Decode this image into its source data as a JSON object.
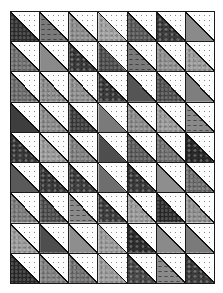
{
  "quilt": {
    "title": "Half-square triangle quilt",
    "columns": 7,
    "rows": 9,
    "light_triangle": {
      "position": "upper-right",
      "fill": "#fdfdfd",
      "pattern": "dots",
      "dot_color": "#8a8a8a"
    },
    "dark_triangle": {
      "position": "lower-left"
    },
    "seam_color": "#1a1a1a",
    "cells": [
      [
        {
          "c": "#2f2f2f",
          "p": "mottled"
        },
        {
          "c": "#7a7a7a",
          "p": "leaf"
        },
        {
          "c": "#8c8c8c",
          "p": "mottled"
        },
        {
          "c": "#a0a0a0",
          "p": "mottled"
        },
        {
          "c": "#555555",
          "p": "mottled"
        },
        {
          "c": "#3e3e3e",
          "p": "paisley"
        },
        {
          "c": "#8a8a8a",
          "p": "solid"
        }
      ],
      [
        {
          "c": "#6e6e6e",
          "p": "mottled"
        },
        {
          "c": "#8a8a8a",
          "p": "solid"
        },
        {
          "c": "#3a3a3a",
          "p": "paisley"
        },
        {
          "c": "#4a4a4a",
          "p": "mottled"
        },
        {
          "c": "#7a7a7a",
          "p": "leaf"
        },
        {
          "c": "#8e8e8e",
          "p": "mottled"
        },
        {
          "c": "#9a9a9a",
          "p": "mottled"
        }
      ],
      [
        {
          "c": "#6a6a6a",
          "p": "mottled"
        },
        {
          "c": "#8a8a8a",
          "p": "mottled"
        },
        {
          "c": "#8e8e8e",
          "p": "mottled"
        },
        {
          "c": "#3a3a3a",
          "p": "paisley"
        },
        {
          "c": "#555555",
          "p": "solid"
        },
        {
          "c": "#4e4e4e",
          "p": "mottled"
        },
        {
          "c": "#7e7e7e",
          "p": "solid"
        }
      ],
      [
        {
          "c": "#3e3e3e",
          "p": "solid"
        },
        {
          "c": "#8a8a8a",
          "p": "mottled"
        },
        {
          "c": "#3a3a3a",
          "p": "mottled"
        },
        {
          "c": "#7a7a7a",
          "p": "solid"
        },
        {
          "c": "#8a8a8a",
          "p": "mottled"
        },
        {
          "c": "#9a9a9a",
          "p": "mottled"
        },
        {
          "c": "#8a8a8a",
          "p": "leaf"
        }
      ],
      [
        {
          "c": "#3a3a3a",
          "p": "paisley"
        },
        {
          "c": "#9a9a9a",
          "p": "mottled"
        },
        {
          "c": "#7e7e7e",
          "p": "mottled"
        },
        {
          "c": "#4e4e4e",
          "p": "solid"
        },
        {
          "c": "#5a5a5a",
          "p": "mottled"
        },
        {
          "c": "#6e6e6e",
          "p": "mottled"
        },
        {
          "c": "#2a2a2a",
          "p": "paisley"
        }
      ],
      [
        {
          "c": "#5a5a5a",
          "p": "solid"
        },
        {
          "c": "#3a3a3a",
          "p": "paisley"
        },
        {
          "c": "#3e3e3e",
          "p": "paisley"
        },
        {
          "c": "#6e6e6e",
          "p": "solid"
        },
        {
          "c": "#3a3a3a",
          "p": "paisley"
        },
        {
          "c": "#8e8e8e",
          "p": "solid"
        },
        {
          "c": "#6a6a6a",
          "p": "mottled"
        }
      ],
      [
        {
          "c": "#7a7a7a",
          "p": "mottled"
        },
        {
          "c": "#4a4a4a",
          "p": "mottled"
        },
        {
          "c": "#8a8a8a",
          "p": "leaf"
        },
        {
          "c": "#3e3e3e",
          "p": "paisley"
        },
        {
          "c": "#9a9a9a",
          "p": "mottled"
        },
        {
          "c": "#2a2a2a",
          "p": "mottled"
        },
        {
          "c": "#8e8e8e",
          "p": "mottled"
        }
      ],
      [
        {
          "c": "#9a9a9a",
          "p": "mottled"
        },
        {
          "c": "#4e4e4e",
          "p": "solid"
        },
        {
          "c": "#8e8e8e",
          "p": "solid"
        },
        {
          "c": "#9a9a9a",
          "p": "mottled"
        },
        {
          "c": "#2e2e2e",
          "p": "paisley"
        },
        {
          "c": "#8a8a8a",
          "p": "solid"
        },
        {
          "c": "#7a7a7a",
          "p": "solid"
        }
      ],
      [
        {
          "c": "#2a2a2a",
          "p": "mottled"
        },
        {
          "c": "#7e7e7e",
          "p": "mottled"
        },
        {
          "c": "#6e6e6e",
          "p": "mottled"
        },
        {
          "c": "#9a9a9a",
          "p": "mottled"
        },
        {
          "c": "#4a4a4a",
          "p": "paisley"
        },
        {
          "c": "#8a8a8a",
          "p": "leaf"
        },
        {
          "c": "#3e3e3e",
          "p": "paisley"
        }
      ]
    ]
  }
}
